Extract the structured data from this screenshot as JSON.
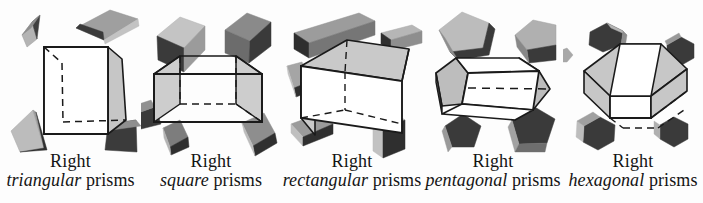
{
  "figure": {
    "background_color": "#fdfdfd",
    "text_color": "#141414",
    "width": 703,
    "height": 203
  },
  "palette": {
    "outline": "#1a1a1a",
    "face_white": "#ffffff",
    "face_light_gray": "#c9c9c9",
    "face_mid_gray": "#a8a8a8",
    "face_dark_gray": "#7b7b7b",
    "face_darkest": "#3c3c3c",
    "dashed_edge": "#1a1a1a"
  },
  "panels": [
    {
      "id": "triangular",
      "caption_line1": "Right",
      "caption_shape": "triangular",
      "caption_prisms": " prisms",
      "main_solid": "right triangular prism",
      "scattered_count": 4
    },
    {
      "id": "square",
      "caption_line1": "Right",
      "caption_shape": "square",
      "caption_prisms": " prisms",
      "main_solid": "right square prism",
      "scattered_count": 5
    },
    {
      "id": "rectangular",
      "caption_line1": "Right",
      "caption_shape": "rectangular",
      "caption_prisms": " prisms",
      "main_solid": "right rectangular prism",
      "scattered_count": 5
    },
    {
      "id": "pentagonal",
      "caption_line1": "Right",
      "caption_shape": "pentagonal",
      "caption_prisms": " prisms",
      "main_solid": "right pentagonal prism",
      "scattered_count": 4
    },
    {
      "id": "hexagonal",
      "caption_line1": "Right",
      "caption_shape": "hexagonal",
      "caption_prisms": " prisms",
      "main_solid": "right hexagonal prism",
      "scattered_count": 5
    }
  ]
}
